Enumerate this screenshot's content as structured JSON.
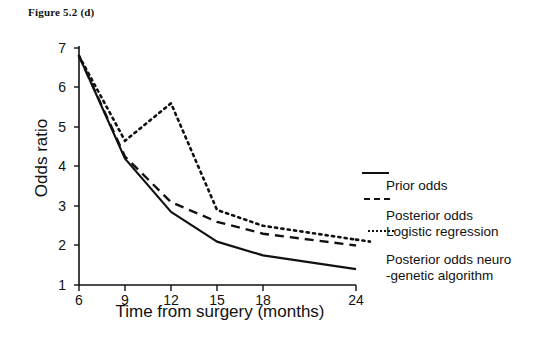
{
  "figure": {
    "caption": "Figure 5.2 (d)"
  },
  "chart_data": {
    "type": "line",
    "title": "Figure 5.2 (d)",
    "xlabel": "Time from surgery (months)",
    "ylabel": "Odds ratio",
    "x": [
      6,
      9,
      12,
      15,
      18,
      24
    ],
    "xtick_labels": [
      "6",
      "9",
      "12",
      "15",
      "18",
      "24"
    ],
    "ytick_labels": [
      "1",
      "2",
      "3",
      "4",
      "5",
      "6",
      "7"
    ],
    "xlim": [
      6,
      24
    ],
    "ylim": [
      1,
      7
    ],
    "grid": false,
    "legend_position": "right",
    "series": [
      {
        "name": "Prior odds",
        "style": "solid",
        "color": "#111111",
        "values": [
          6.8,
          4.2,
          2.85,
          2.1,
          1.75,
          1.4
        ]
      },
      {
        "name": "Posterior odds\nLogistic regression",
        "style": "dashed",
        "color": "#111111",
        "values": [
          6.8,
          4.25,
          3.1,
          2.6,
          2.3,
          2.0
        ]
      },
      {
        "name": "Posterior odds neuro\n-genetic algorithm",
        "style": "dotted",
        "color": "#111111",
        "values": [
          6.8,
          4.65,
          5.6,
          2.9,
          2.5,
          2.15
        ]
      }
    ]
  },
  "axes": {
    "y_title": "Odds ratio",
    "x_title": "Time from surgery (months)",
    "y_ticks": [
      "7",
      "6",
      "5",
      "4",
      "3",
      "2",
      "1"
    ],
    "x_ticks": [
      "6",
      "9",
      "12",
      "15",
      "18",
      "24"
    ]
  },
  "legend": {
    "items": [
      {
        "label": "Prior odds",
        "style": "solid"
      },
      {
        "label": "Posterior odds\nLogistic regression",
        "style": "dashed"
      },
      {
        "label": "Posterior odds neuro\n-genetic algorithm",
        "style": "dotted"
      }
    ]
  }
}
